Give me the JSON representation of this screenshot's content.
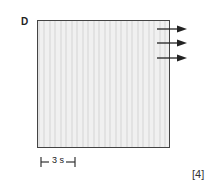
{
  "figure": {
    "panel_label": "D",
    "stripe_orientation": "vertical",
    "arrows": [
      {
        "direction": "right",
        "y": 29
      },
      {
        "direction": "right",
        "y": 43
      },
      {
        "direction": "right",
        "y": 58
      }
    ],
    "scale_bar": {
      "label": "3 s"
    },
    "marks": "[4]",
    "colors": {
      "frame": "#444444",
      "fill": "#e9e9e9",
      "arrow": "#222222"
    }
  }
}
